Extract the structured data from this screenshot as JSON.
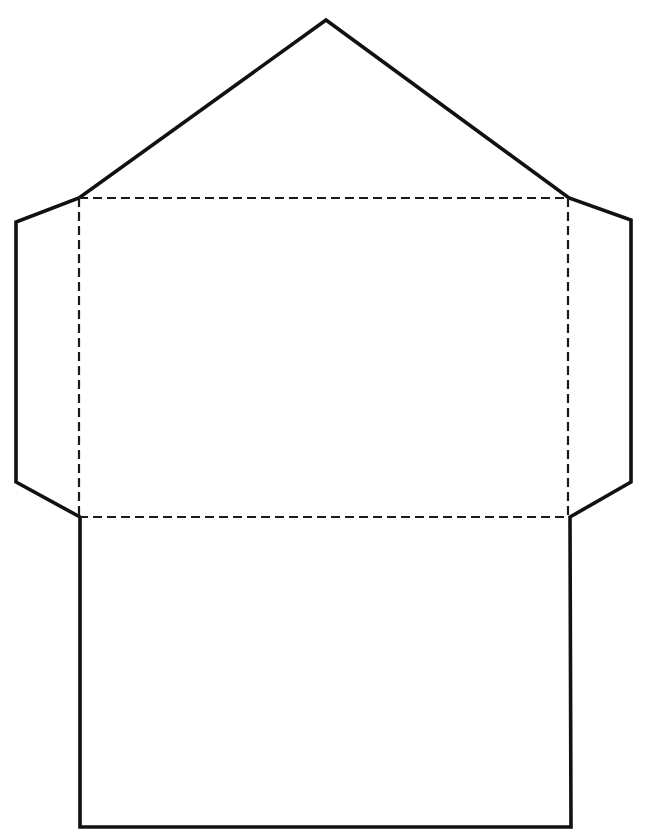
{
  "document": {
    "title": "Envelope Template",
    "description": "Flat die-line pattern for a folded paper envelope",
    "page_width": 648,
    "page_height": 837,
    "background_color": "#ffffff"
  },
  "style": {
    "cut_line_color": "#111111",
    "cut_line_width": 3.6,
    "fold_line_color": "#1a1a1a",
    "fold_line_width": 2.2,
    "fold_dash_pattern": "9 5"
  },
  "geometry": {
    "cut_outline_points": "326,20 79,198 16,222 16,482 80,517 80,827 571,827 570,517 631,482 631,220 569,198",
    "fold_top": "79,198 568,198",
    "fold_bottom": "79,517 568,517",
    "fold_left": "79,198 79,517",
    "fold_right": "568,198 568,517"
  },
  "parts": {
    "top_flap_label": "top-flap",
    "left_flap_label": "left-side-flap",
    "right_flap_label": "right-side-flap",
    "bottom_flap_label": "bottom-flap",
    "body_panel_label": "main-body-panel"
  },
  "key_points": {
    "apex": [
      326,
      20
    ],
    "top_left_fold_corner": [
      79,
      198
    ],
    "top_right_fold_corner": [
      568,
      198
    ],
    "left_shoulder": [
      16,
      222
    ],
    "right_shoulder": [
      631,
      220
    ],
    "left_waist": [
      16,
      482
    ],
    "right_waist": [
      631,
      482
    ],
    "bottom_left_fold_corner": [
      80,
      517
    ],
    "bottom_right_fold_corner": [
      570,
      517
    ],
    "bottom_left": [
      80,
      827
    ],
    "bottom_right": [
      571,
      827
    ]
  }
}
